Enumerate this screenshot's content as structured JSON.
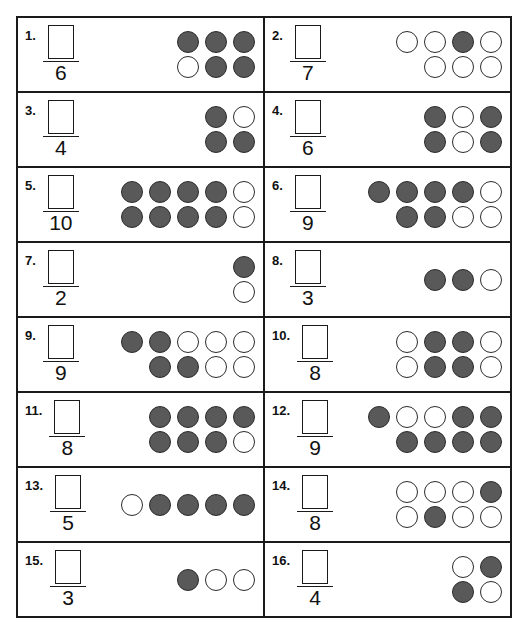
{
  "worksheet": {
    "title": "Fraction counters worksheet",
    "colors": {
      "filled": "#595959",
      "empty": "#ffffff",
      "outline": "#2b2b2b",
      "border": "#1a1a1a"
    },
    "items": [
      {
        "number": "1.",
        "denominator": "6",
        "answer_value": "",
        "total": 6,
        "filled_count": 5,
        "rows": [
          [
            "filled",
            "filled",
            "filled"
          ],
          [
            "empty",
            "filled",
            "filled"
          ]
        ]
      },
      {
        "number": "2.",
        "denominator": "7",
        "answer_value": "",
        "total": 7,
        "filled_count": 1,
        "rows": [
          [
            "empty",
            "empty",
            "filled",
            "empty"
          ],
          [
            "empty",
            "empty",
            "empty"
          ]
        ]
      },
      {
        "number": "3.",
        "denominator": "4",
        "answer_value": "",
        "total": 4,
        "filled_count": 3,
        "rows": [
          [
            "filled",
            "empty"
          ],
          [
            "filled",
            "filled"
          ]
        ]
      },
      {
        "number": "4.",
        "denominator": "6",
        "answer_value": "",
        "total": 6,
        "filled_count": 4,
        "rows": [
          [
            "filled",
            "empty",
            "filled"
          ],
          [
            "filled",
            "empty",
            "filled"
          ]
        ]
      },
      {
        "number": "5.",
        "denominator": "10",
        "answer_value": "",
        "total": 10,
        "filled_count": 8,
        "rows": [
          [
            "filled",
            "filled",
            "filled",
            "filled",
            "empty"
          ],
          [
            "filled",
            "filled",
            "filled",
            "filled",
            "empty"
          ]
        ]
      },
      {
        "number": "6.",
        "denominator": "9",
        "answer_value": "",
        "total": 9,
        "filled_count": 6,
        "rows": [
          [
            "filled",
            "filled",
            "filled",
            "filled",
            "empty"
          ],
          [
            "filled",
            "filled",
            "empty",
            "empty"
          ]
        ]
      },
      {
        "number": "7.",
        "denominator": "2",
        "answer_value": "",
        "total": 2,
        "filled_count": 1,
        "rows": [
          [
            "filled"
          ],
          [
            "empty"
          ]
        ]
      },
      {
        "number": "8.",
        "denominator": "3",
        "answer_value": "",
        "total": 3,
        "filled_count": 2,
        "rows": [
          [
            "filled",
            "filled",
            "empty"
          ]
        ]
      },
      {
        "number": "9.",
        "denominator": "9",
        "answer_value": "",
        "total": 9,
        "filled_count": 4,
        "rows": [
          [
            "filled",
            "filled",
            "empty",
            "empty",
            "empty"
          ],
          [
            "filled",
            "filled",
            "empty",
            "empty"
          ]
        ]
      },
      {
        "number": "10.",
        "denominator": "8",
        "answer_value": "",
        "total": 8,
        "filled_count": 4,
        "rows": [
          [
            "empty",
            "filled",
            "filled",
            "empty"
          ],
          [
            "empty",
            "filled",
            "filled",
            "empty"
          ]
        ]
      },
      {
        "number": "11.",
        "denominator": "8",
        "answer_value": "",
        "total": 8,
        "filled_count": 7,
        "rows": [
          [
            "filled",
            "filled",
            "filled",
            "filled"
          ],
          [
            "filled",
            "filled",
            "filled",
            "empty"
          ]
        ]
      },
      {
        "number": "12.",
        "denominator": "9",
        "answer_value": "",
        "total": 9,
        "filled_count": 7,
        "rows": [
          [
            "filled",
            "empty",
            "empty",
            "filled",
            "filled"
          ],
          [
            "filled",
            "filled",
            "filled",
            "filled"
          ]
        ]
      },
      {
        "number": "13.",
        "denominator": "5",
        "answer_value": "",
        "total": 5,
        "filled_count": 4,
        "rows": [
          [
            "empty",
            "filled",
            "filled",
            "filled",
            "filled"
          ]
        ]
      },
      {
        "number": "14.",
        "denominator": "8",
        "answer_value": "",
        "total": 8,
        "filled_count": 2,
        "rows": [
          [
            "empty",
            "empty",
            "empty",
            "filled"
          ],
          [
            "empty",
            "filled",
            "empty",
            "empty"
          ]
        ]
      },
      {
        "number": "15.",
        "denominator": "3",
        "answer_value": "",
        "total": 3,
        "filled_count": 1,
        "rows": [
          [
            "filled",
            "empty",
            "empty"
          ]
        ]
      },
      {
        "number": "16.",
        "denominator": "4",
        "answer_value": "",
        "total": 4,
        "filled_count": 2,
        "rows": [
          [
            "empty",
            "filled"
          ],
          [
            "filled",
            "empty"
          ]
        ]
      }
    ]
  }
}
